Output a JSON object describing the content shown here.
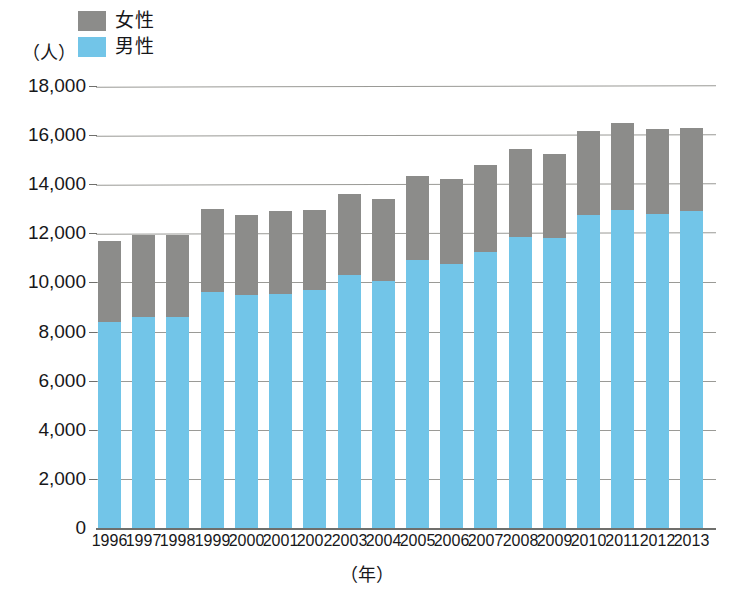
{
  "chart_data": {
    "type": "bar",
    "stacked": true,
    "title": "",
    "xlabel": "（年）",
    "ylabel": "（人）",
    "ylim": [
      0,
      18000
    ],
    "ytick_step": 2000,
    "yticks": [
      "0",
      "2,000",
      "4,000",
      "6,000",
      "8,000",
      "10,000",
      "12,000",
      "14,000",
      "16,000",
      "18,000"
    ],
    "grid": true,
    "legend_position": "top-left",
    "categories": [
      "1996",
      "1997",
      "1998",
      "1999",
      "2000",
      "2001",
      "2002",
      "2003",
      "2004",
      "2005",
      "2006",
      "2007",
      "2008",
      "2009",
      "2010",
      "2011",
      "2012",
      "2013"
    ],
    "series": [
      {
        "name": "男性",
        "color": "#72c5e8",
        "values": [
          8400,
          8600,
          8600,
          9600,
          9500,
          9550,
          9700,
          10300,
          10050,
          10900,
          10750,
          11250,
          11850,
          11800,
          12750,
          12950,
          12800,
          12900
        ]
      },
      {
        "name": "女性",
        "color": "#8c8c8a",
        "values": [
          3300,
          3350,
          3350,
          3400,
          3250,
          3350,
          3250,
          3300,
          3350,
          3450,
          3450,
          3550,
          3600,
          3450,
          3400,
          3550,
          3450,
          3400
        ]
      }
    ],
    "totals": [
      11700,
      11950,
      11950,
      13000,
      12750,
      12900,
      12950,
      13600,
      13400,
      14350,
      14200,
      14800,
      15450,
      15250,
      16150,
      16500,
      16250,
      16300
    ]
  },
  "legend": {
    "items": [
      {
        "label": "女性",
        "color": "#8c8c8a"
      },
      {
        "label": "男性",
        "color": "#72c5e8"
      }
    ]
  },
  "axes": {
    "y_unit": "（人）",
    "x_unit": "（年）"
  }
}
